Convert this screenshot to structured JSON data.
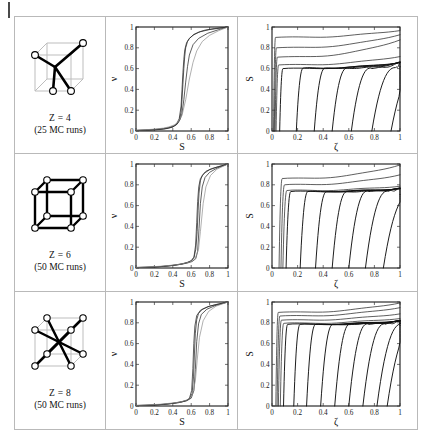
{
  "figure": {
    "title": "",
    "rows": [
      {
        "id": "row-z4",
        "lattice": {
          "label": "Z = 4",
          "runs": "(25 MC runs)",
          "coordination": 4,
          "type": "tetrahedral"
        },
        "middle_chart": "chart_mid_z4",
        "right_chart": "chart_right_z4"
      },
      {
        "id": "row-z6",
        "lattice": {
          "label": "Z = 6",
          "runs": "(50 MC runs)",
          "coordination": 6,
          "type": "simple-cubic"
        },
        "middle_chart": "chart_mid_z6",
        "right_chart": "chart_right_z6"
      },
      {
        "id": "row-z8",
        "lattice": {
          "label": "Z = 8",
          "runs": "(50 MC runs)",
          "coordination": 8,
          "type": "body-centered-cubic"
        },
        "middle_chart": "chart_mid_z8",
        "right_chart": "chart_right_z8"
      }
    ]
  },
  "chart_data": [
    {
      "id": "chart_mid_z4",
      "type": "line",
      "title": "",
      "xlabel": "S",
      "ylabel": "ν",
      "xlim": [
        0,
        1
      ],
      "ylim": [
        0,
        1
      ],
      "xticks": [
        0,
        0.2,
        0.4,
        0.6,
        0.8,
        1
      ],
      "xticklabels": [
        "0",
        "0.2",
        "0.4",
        "0.6",
        "0.8",
        "1"
      ],
      "yticks": [
        0,
        0.2,
        0.4,
        0.6,
        0.8,
        1
      ],
      "yticklabels": [
        "0",
        "0.2",
        "0.4",
        "0.6",
        "0.8",
        "1"
      ],
      "grid": false,
      "legend": "none",
      "series": [
        {
          "name": "run-bundle-center",
          "midpoint": 0.52,
          "steepness": 34,
          "x": [
            0,
            0.1,
            0.2,
            0.3,
            0.35,
            0.4,
            0.44,
            0.47,
            0.49,
            0.5,
            0.51,
            0.52,
            0.53,
            0.54,
            0.56,
            0.58,
            0.62,
            0.68,
            0.75,
            0.85,
            1
          ],
          "y": [
            0.005,
            0.008,
            0.012,
            0.02,
            0.028,
            0.04,
            0.06,
            0.1,
            0.18,
            0.3,
            0.45,
            0.6,
            0.72,
            0.8,
            0.86,
            0.89,
            0.92,
            0.95,
            0.97,
            0.985,
            1
          ]
        },
        {
          "name": "run-bundle-left",
          "midpoint": 0.505,
          "steepness": 36,
          "x": [
            0,
            0.1,
            0.2,
            0.3,
            0.35,
            0.4,
            0.44,
            0.47,
            0.49,
            0.5,
            0.51,
            0.52,
            0.53,
            0.55,
            0.58,
            0.63,
            0.7,
            0.8,
            1
          ],
          "y": [
            0.004,
            0.007,
            0.011,
            0.018,
            0.026,
            0.038,
            0.065,
            0.12,
            0.24,
            0.4,
            0.56,
            0.69,
            0.78,
            0.85,
            0.89,
            0.93,
            0.955,
            0.975,
            1
          ]
        },
        {
          "name": "run-bundle-right",
          "midpoint": 0.545,
          "steepness": 30,
          "x": [
            0,
            0.1,
            0.2,
            0.3,
            0.35,
            0.4,
            0.45,
            0.48,
            0.5,
            0.52,
            0.54,
            0.56,
            0.58,
            0.62,
            0.68,
            0.78,
            0.9,
            1
          ],
          "y": [
            0.006,
            0.01,
            0.015,
            0.024,
            0.032,
            0.045,
            0.07,
            0.11,
            0.17,
            0.3,
            0.47,
            0.62,
            0.73,
            0.83,
            0.89,
            0.94,
            0.975,
            1
          ]
        },
        {
          "name": "run-envelope-outer",
          "midpoint": 0.565,
          "steepness": 24,
          "style": "faint",
          "x": [
            0,
            0.1,
            0.2,
            0.3,
            0.36,
            0.42,
            0.46,
            0.5,
            0.54,
            0.58,
            0.62,
            0.66,
            0.72,
            0.8,
            0.9,
            1
          ],
          "y": [
            0.008,
            0.012,
            0.018,
            0.028,
            0.04,
            0.06,
            0.09,
            0.15,
            0.3,
            0.5,
            0.66,
            0.77,
            0.86,
            0.92,
            0.965,
            1
          ]
        }
      ]
    },
    {
      "id": "chart_right_z4",
      "type": "line",
      "title": "",
      "xlabel": "ζ",
      "ylabel": "S",
      "xlim": [
        0,
        1
      ],
      "ylim": [
        0,
        1
      ],
      "xticks": [
        0,
        0.2,
        0.4,
        0.6,
        0.8,
        1
      ],
      "xticklabels": [
        "0",
        "0.2",
        "0.4",
        "0.6",
        "0.8",
        "1"
      ],
      "yticks": [
        0,
        0.2,
        0.4,
        0.6,
        0.8,
        1
      ],
      "yticklabels": [
        "0",
        "0.2",
        "0.4",
        "0.6",
        "0.8",
        "1"
      ],
      "grid": false,
      "legend": "none",
      "description": "Family of sharp S-vs-zeta transitions; plateau height decreases as onset zeta increases.",
      "series": [
        {
          "name": "plateau-0.97",
          "onset": 0.012,
          "plateau": 0.9,
          "final": 0.97
        },
        {
          "name": "plateau-0.86",
          "onset": 0.018,
          "plateau": 0.8,
          "final": 0.93
        },
        {
          "name": "plateau-0.74",
          "onset": 0.024,
          "plateau": 0.71,
          "final": 0.88
        },
        {
          "name": "plateau-0.64",
          "onset": 0.032,
          "plateau": 0.635,
          "final": 0.72
        },
        {
          "name": "step-0.06",
          "onset": 0.06,
          "plateau": 0.6,
          "final": 0.66
        },
        {
          "name": "step-0.19",
          "onset": 0.19,
          "plateau": 0.605,
          "final": 0.66
        },
        {
          "name": "step-0.33",
          "onset": 0.33,
          "plateau": 0.605,
          "final": 0.66
        },
        {
          "name": "step-0.47",
          "onset": 0.47,
          "plateau": 0.605,
          "final": 0.66
        },
        {
          "name": "step-0.62",
          "onset": 0.62,
          "plateau": 0.605,
          "final": 0.66
        },
        {
          "name": "step-0.78",
          "onset": 0.78,
          "plateau": 0.61,
          "final": 0.66
        },
        {
          "name": "step-0.93",
          "onset": 0.93,
          "plateau": 0.615,
          "final": 0.66
        }
      ]
    },
    {
      "id": "chart_mid_z6",
      "type": "line",
      "title": "",
      "xlabel": "S",
      "ylabel": "ν",
      "xlim": [
        0,
        1
      ],
      "ylim": [
        0,
        1
      ],
      "xticks": [
        0,
        0.2,
        0.4,
        0.6,
        0.8,
        1
      ],
      "xticklabels": [
        "0",
        "0.2",
        "0.4",
        "0.6",
        "0.8",
        "1"
      ],
      "yticks": [
        0,
        0.2,
        0.4,
        0.6,
        0.8,
        1
      ],
      "yticklabels": [
        "0",
        "0.2",
        "0.4",
        "0.6",
        "0.8",
        "1"
      ],
      "grid": false,
      "legend": "none",
      "series": [
        {
          "name": "run-bundle-center",
          "midpoint": 0.675,
          "steepness": 60,
          "x": [
            0,
            0.1,
            0.2,
            0.3,
            0.4,
            0.5,
            0.56,
            0.6,
            0.63,
            0.65,
            0.665,
            0.675,
            0.685,
            0.7,
            0.72,
            0.76,
            0.82,
            0.9,
            1
          ],
          "y": [
            0.004,
            0.006,
            0.01,
            0.016,
            0.026,
            0.04,
            0.055,
            0.07,
            0.1,
            0.18,
            0.35,
            0.55,
            0.72,
            0.84,
            0.89,
            0.93,
            0.955,
            0.975,
            1
          ]
        },
        {
          "name": "run-bundle-left",
          "midpoint": 0.665,
          "steepness": 64,
          "x": [
            0,
            0.1,
            0.2,
            0.3,
            0.4,
            0.5,
            0.56,
            0.6,
            0.63,
            0.648,
            0.66,
            0.67,
            0.682,
            0.7,
            0.74,
            0.8,
            0.88,
            1
          ],
          "y": [
            0.004,
            0.006,
            0.009,
            0.015,
            0.024,
            0.038,
            0.052,
            0.068,
            0.105,
            0.22,
            0.44,
            0.64,
            0.78,
            0.86,
            0.91,
            0.945,
            0.97,
            1
          ]
        },
        {
          "name": "run-bundle-right",
          "midpoint": 0.688,
          "steepness": 54,
          "x": [
            0,
            0.12,
            0.25,
            0.35,
            0.45,
            0.55,
            0.61,
            0.65,
            0.67,
            0.685,
            0.7,
            0.72,
            0.75,
            0.8,
            0.88,
            1
          ],
          "y": [
            0.005,
            0.008,
            0.013,
            0.02,
            0.03,
            0.046,
            0.062,
            0.09,
            0.16,
            0.38,
            0.62,
            0.78,
            0.87,
            0.92,
            0.96,
            1
          ]
        },
        {
          "name": "run-envelope-outer",
          "midpoint": 0.7,
          "steepness": 40,
          "style": "faint",
          "x": [
            0,
            0.12,
            0.25,
            0.38,
            0.48,
            0.58,
            0.64,
            0.68,
            0.7,
            0.73,
            0.76,
            0.81,
            0.88,
            1
          ],
          "y": [
            0.006,
            0.01,
            0.016,
            0.026,
            0.036,
            0.056,
            0.085,
            0.18,
            0.35,
            0.62,
            0.78,
            0.89,
            0.95,
            1
          ]
        }
      ]
    },
    {
      "id": "chart_right_z6",
      "type": "line",
      "title": "",
      "xlabel": "ζ",
      "ylabel": "S",
      "xlim": [
        0,
        1
      ],
      "ylim": [
        0,
        1
      ],
      "xticks": [
        0,
        0.2,
        0.4,
        0.6,
        0.8,
        1
      ],
      "xticklabels": [
        "0",
        "0.2",
        "0.4",
        "0.6",
        "0.8",
        "1"
      ],
      "yticks": [
        0,
        0.2,
        0.4,
        0.6,
        0.8,
        1
      ],
      "yticklabels": [
        "0",
        "0.2",
        "0.4",
        "0.6",
        "0.8",
        "1"
      ],
      "grid": false,
      "legend": "none",
      "description": "Fewer, more widely spaced step curves than Z = 4; plateau band near S = 0.75.",
      "series": [
        {
          "name": "plateau-0.99",
          "onset": 0.055,
          "plateau": 0.86,
          "final": 0.995
        },
        {
          "name": "plateau-0.88",
          "onset": 0.07,
          "plateau": 0.8,
          "final": 0.9
        },
        {
          "name": "plateau-0.78",
          "onset": 0.085,
          "plateau": 0.745,
          "final": 0.79
        },
        {
          "name": "step-0.11",
          "onset": 0.11,
          "plateau": 0.735,
          "final": 0.765
        },
        {
          "name": "step-0.22",
          "onset": 0.22,
          "plateau": 0.735,
          "final": 0.765
        },
        {
          "name": "step-0.34",
          "onset": 0.34,
          "plateau": 0.735,
          "final": 0.765
        },
        {
          "name": "step-0.47",
          "onset": 0.47,
          "plateau": 0.735,
          "final": 0.765
        },
        {
          "name": "step-0.60",
          "onset": 0.6,
          "plateau": 0.74,
          "final": 0.765
        },
        {
          "name": "step-0.73",
          "onset": 0.73,
          "plateau": 0.74,
          "final": 0.765
        },
        {
          "name": "step-0.87",
          "onset": 0.87,
          "plateau": 0.7,
          "final": 0.765
        }
      ]
    },
    {
      "id": "chart_mid_z8",
      "type": "line",
      "title": "",
      "xlabel": "S",
      "ylabel": "ν",
      "xlim": [
        0,
        1
      ],
      "ylim": [
        0,
        1
      ],
      "xticks": [
        0,
        0.2,
        0.4,
        0.6,
        0.8,
        1
      ],
      "xticklabels": [
        "0",
        "0.2",
        "0.4",
        "0.6",
        "0.8",
        "1"
      ],
      "yticks": [
        0,
        0.2,
        0.4,
        0.6,
        0.8,
        1
      ],
      "yticklabels": [
        "0",
        "0.2",
        "0.4",
        "0.6",
        "0.8",
        "1"
      ],
      "grid": false,
      "legend": "none",
      "series": [
        {
          "name": "run-bundle-center",
          "midpoint": 0.635,
          "steepness": 70,
          "x": [
            0,
            0.1,
            0.2,
            0.3,
            0.4,
            0.5,
            0.55,
            0.58,
            0.61,
            0.625,
            0.635,
            0.645,
            0.66,
            0.68,
            0.72,
            0.8,
            0.9,
            1
          ],
          "y": [
            0.004,
            0.006,
            0.01,
            0.016,
            0.026,
            0.042,
            0.055,
            0.07,
            0.12,
            0.28,
            0.5,
            0.7,
            0.83,
            0.89,
            0.93,
            0.96,
            0.98,
            1
          ]
        },
        {
          "name": "run-bundle-left",
          "midpoint": 0.625,
          "steepness": 74,
          "x": [
            0,
            0.1,
            0.2,
            0.3,
            0.4,
            0.5,
            0.55,
            0.58,
            0.605,
            0.618,
            0.628,
            0.64,
            0.66,
            0.7,
            0.78,
            0.88,
            1
          ],
          "y": [
            0.004,
            0.006,
            0.009,
            0.015,
            0.025,
            0.04,
            0.053,
            0.072,
            0.15,
            0.36,
            0.6,
            0.77,
            0.87,
            0.92,
            0.955,
            0.978,
            1
          ]
        },
        {
          "name": "run-bundle-right",
          "midpoint": 0.648,
          "steepness": 62,
          "x": [
            0,
            0.12,
            0.25,
            0.36,
            0.46,
            0.55,
            0.6,
            0.63,
            0.645,
            0.66,
            0.68,
            0.71,
            0.77,
            0.86,
            1
          ],
          "y": [
            0.005,
            0.008,
            0.013,
            0.021,
            0.031,
            0.05,
            0.075,
            0.15,
            0.35,
            0.62,
            0.79,
            0.88,
            0.93,
            0.965,
            1
          ]
        },
        {
          "name": "run-envelope-outer",
          "midpoint": 0.665,
          "steepness": 42,
          "style": "faint",
          "x": [
            0,
            0.12,
            0.26,
            0.38,
            0.48,
            0.56,
            0.61,
            0.645,
            0.665,
            0.69,
            0.73,
            0.79,
            0.87,
            1
          ],
          "y": [
            0.006,
            0.01,
            0.017,
            0.027,
            0.038,
            0.06,
            0.1,
            0.24,
            0.44,
            0.66,
            0.82,
            0.91,
            0.96,
            1
          ]
        }
      ]
    },
    {
      "id": "chart_right_z8",
      "type": "line",
      "title": "",
      "xlabel": "ζ",
      "ylabel": "S",
      "xlim": [
        0,
        1
      ],
      "ylim": [
        0,
        1
      ],
      "xticks": [
        0,
        0.2,
        0.4,
        0.6,
        0.8,
        1
      ],
      "xticklabels": [
        "0",
        "0.2",
        "0.4",
        "0.6",
        "0.8",
        "1"
      ],
      "yticks": [
        0,
        0.2,
        0.4,
        0.6,
        0.8,
        1
      ],
      "yticklabels": [
        "0",
        "0.2",
        "0.4",
        "0.6",
        "0.8",
        "1"
      ],
      "grid": false,
      "legend": "none",
      "description": "Dense family of near-vertical step curves with plateau band near S = 0.80.",
      "series": [
        {
          "name": "plateau-0.99",
          "onset": 0.03,
          "plateau": 0.9,
          "final": 0.995
        },
        {
          "name": "plateau-0.93",
          "onset": 0.04,
          "plateau": 0.865,
          "final": 0.95
        },
        {
          "name": "plateau-0.86",
          "onset": 0.05,
          "plateau": 0.825,
          "final": 0.89
        },
        {
          "name": "plateau-0.81",
          "onset": 0.065,
          "plateau": 0.795,
          "final": 0.845
        },
        {
          "name": "step-0.09",
          "onset": 0.09,
          "plateau": 0.785,
          "final": 0.82
        },
        {
          "name": "step-0.17",
          "onset": 0.17,
          "plateau": 0.785,
          "final": 0.82
        },
        {
          "name": "step-0.27",
          "onset": 0.27,
          "plateau": 0.785,
          "final": 0.82
        },
        {
          "name": "step-0.38",
          "onset": 0.38,
          "plateau": 0.785,
          "final": 0.82
        },
        {
          "name": "step-0.49",
          "onset": 0.49,
          "plateau": 0.79,
          "final": 0.82
        },
        {
          "name": "step-0.60",
          "onset": 0.6,
          "plateau": 0.79,
          "final": 0.82
        },
        {
          "name": "step-0.71",
          "onset": 0.71,
          "plateau": 0.79,
          "final": 0.82
        },
        {
          "name": "step-0.82",
          "onset": 0.82,
          "plateau": 0.79,
          "final": 0.82
        },
        {
          "name": "step-0.90",
          "onset": 0.9,
          "plateau": 0.77,
          "final": 0.82
        }
      ]
    }
  ]
}
